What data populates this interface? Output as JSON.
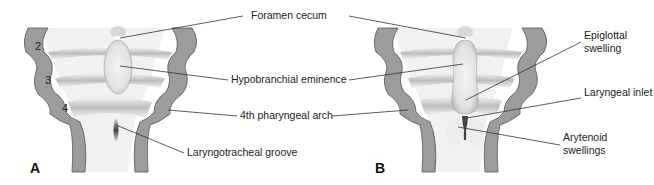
{
  "figure": {
    "panels": [
      {
        "letter": "A",
        "arch_numbers": [
          "2",
          "3",
          "4"
        ]
      },
      {
        "letter": "B"
      }
    ],
    "labels": {
      "foramen_cecum": "Foramen cecum",
      "hypobranchial_eminence": "Hypobranchial eminence",
      "fourth_pharyngeal_arch": "4th pharyngeal arch",
      "laryngotracheal_groove": "Laryngotracheal groove",
      "epiglottal_swelling": "Epiglottal swelling",
      "laryngeal_inlet": "Laryngeal inlet",
      "arytenoid_swellings": "Arytenoid swellings"
    },
    "colors": {
      "arch_wall": "#9a9a9a",
      "arch_outline": "#555555",
      "floor_light": "#f2f2f2",
      "floor_band": "#c8c8c8",
      "leader_line": "#333333",
      "text": "#222222"
    }
  }
}
